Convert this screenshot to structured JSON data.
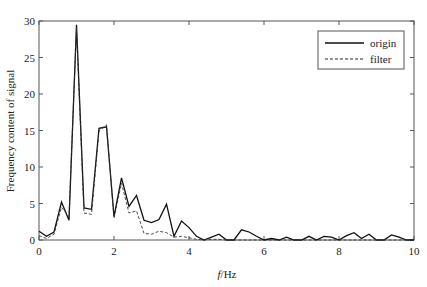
{
  "chart_data": {
    "type": "line",
    "title": "",
    "xlabel_italic": "f",
    "xlabel_rest": "/Hz",
    "xlabel": "f/Hz",
    "ylabel": "Frequency content of signal",
    "xlim": [
      0,
      10
    ],
    "ylim": [
      0,
      30
    ],
    "xticks": [
      0,
      2,
      4,
      6,
      8,
      10
    ],
    "yticks": [
      0,
      5,
      10,
      15,
      20,
      25,
      30
    ],
    "grid": false,
    "legend_position": "upper right",
    "x": [
      0,
      0.2,
      0.4,
      0.6,
      0.8,
      1.0,
      1.2,
      1.4,
      1.6,
      1.8,
      2.0,
      2.2,
      2.4,
      2.6,
      2.8,
      3.0,
      3.2,
      3.4,
      3.6,
      3.8,
      4.0,
      4.2,
      4.4,
      4.6,
      4.8,
      5.0,
      5.2,
      5.4,
      5.6,
      5.8,
      6.0,
      6.2,
      6.4,
      6.6,
      6.8,
      7.0,
      7.2,
      7.4,
      7.6,
      7.8,
      8.0,
      8.2,
      8.4,
      8.6,
      8.8,
      9.0,
      9.2,
      9.4,
      9.6,
      9.8,
      10.0
    ],
    "series": [
      {
        "name": "origin",
        "style": "solid",
        "color": "#111111",
        "values": [
          1.2,
          0.5,
          1.1,
          5.2,
          2.7,
          29.5,
          4.4,
          4.2,
          15.3,
          15.5,
          3.2,
          8.5,
          4.6,
          6.1,
          2.7,
          2.4,
          2.8,
          4.9,
          0.5,
          2.6,
          1.7,
          0.5,
          0.0,
          0.4,
          0.8,
          0.0,
          0.0,
          1.4,
          1.1,
          0.5,
          0.0,
          0.2,
          0.0,
          0.4,
          0.0,
          0.0,
          0.5,
          0.0,
          0.5,
          0.4,
          0.0,
          0.6,
          1.0,
          0.2,
          0.8,
          0.0,
          0.0,
          0.7,
          0.4,
          0.0,
          0.0
        ]
      },
      {
        "name": "filter",
        "style": "dashed",
        "color": "#333333",
        "values": [
          0.6,
          0.2,
          0.8,
          4.5,
          3.2,
          29.0,
          3.7,
          3.5,
          14.9,
          15.8,
          3.0,
          7.8,
          3.7,
          4.0,
          0.9,
          0.8,
          1.2,
          1.0,
          0.4,
          0.5,
          0.3,
          0.1,
          0.0,
          0.1,
          0.1,
          0.0,
          0.0,
          0.0,
          0.0,
          0.0,
          0.0,
          0.0,
          0.0,
          0.0,
          0.0,
          0.0,
          0.0,
          0.0,
          0.0,
          0.0,
          0.0,
          0.0,
          0.0,
          0.0,
          0.0,
          0.0,
          0.0,
          0.0,
          0.0,
          0.0,
          0.0
        ]
      }
    ]
  },
  "legend": {
    "items": [
      {
        "label": "origin",
        "style": "solid"
      },
      {
        "label": "filter",
        "style": "dashed"
      }
    ]
  }
}
